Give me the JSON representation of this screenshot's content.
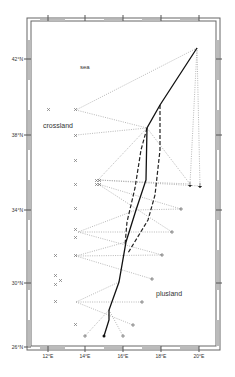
{
  "map": {
    "labels": {
      "sea": "sea",
      "crossland": "crossland",
      "plusland": "plusland"
    },
    "x_axis": {
      "ticks": [
        {
          "label": "12°E",
          "x": 48
        },
        {
          "label": "14°E",
          "x": 85
        },
        {
          "label": "16°E",
          "x": 123
        },
        {
          "label": "18°E",
          "x": 161
        },
        {
          "label": "20°E",
          "x": 199
        }
      ]
    },
    "y_axis": {
      "ticks": [
        {
          "label": "42°N",
          "y": 59
        },
        {
          "label": "38°N",
          "y": 135
        },
        {
          "label": "34°N",
          "y": 210
        },
        {
          "label": "30°N",
          "y": 283
        },
        {
          "label": "26°N",
          "y": 347
        }
      ]
    },
    "colors": {
      "frame": "#555555",
      "track": "#222222",
      "dotted": "#888888",
      "marker": "#666666"
    }
  }
}
